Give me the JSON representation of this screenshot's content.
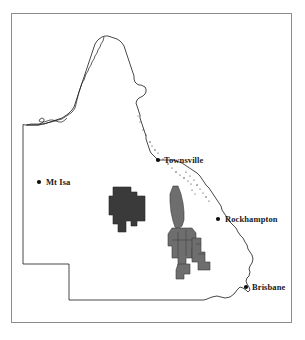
{
  "figure": {
    "region": "Queensland",
    "background_color": "#ffffff",
    "frame_color": "#8c8c8c"
  },
  "map": {
    "outline_color": "#1a1a1a",
    "basins": [
      {
        "name": "galilee-basin",
        "fill": "#3a3a3a",
        "stroke": "#2a2a2a"
      },
      {
        "name": "bowen-basin",
        "fill": "#6e6e6e",
        "stroke": "#3a3a3a"
      }
    ],
    "cities": [
      {
        "name": "mt-isa",
        "label": "Mt Isa",
        "x": 39,
        "y": 182,
        "label_side": "right"
      },
      {
        "name": "townsville",
        "label": "Townsville",
        "x": 158,
        "y": 160,
        "label_side": "right"
      },
      {
        "name": "rockhampton",
        "label": "Rockhampton",
        "x": 218,
        "y": 219,
        "label_side": "right"
      },
      {
        "name": "brisbane",
        "label": "Brisbane",
        "x": 246,
        "y": 287,
        "label_side": "right"
      }
    ]
  }
}
